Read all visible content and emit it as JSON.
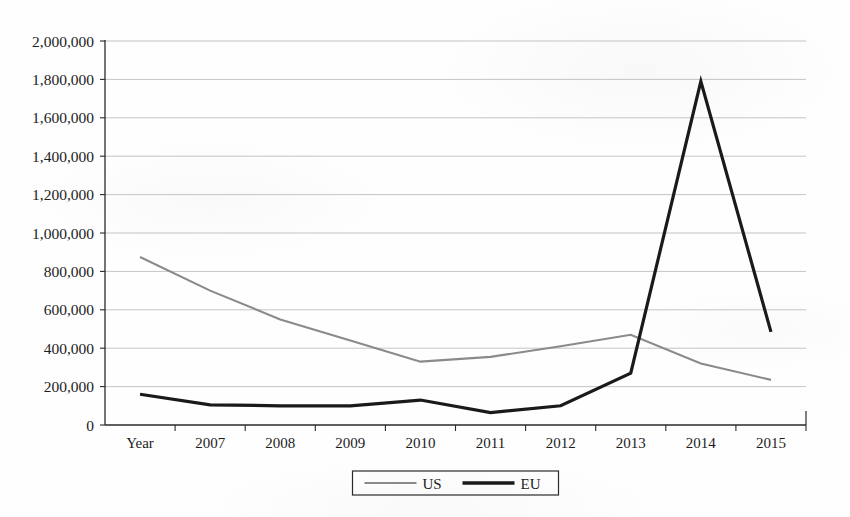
{
  "chart_data": {
    "type": "line",
    "title": "",
    "subtitle": "",
    "xlabel": "",
    "ylabel": "",
    "categories": [
      "Year",
      "2007",
      "2008",
      "2009",
      "2010",
      "2011",
      "2012",
      "2013",
      "2014",
      "2015"
    ],
    "series": [
      {
        "name": "US",
        "color": "#8a8a8a",
        "stroke_width": 2.1,
        "values": [
          875000,
          700000,
          550000,
          440000,
          330000,
          355000,
          410000,
          470000,
          320000,
          235000
        ]
      },
      {
        "name": "EU",
        "color": "#1a1a1a",
        "stroke_width": 3.2,
        "values": [
          160000,
          105000,
          100000,
          100000,
          130000,
          65000,
          100000,
          270000,
          1790000,
          485000
        ]
      }
    ],
    "ylim": [
      0,
      2000000
    ],
    "ytick_step": 200000,
    "ytick_labels": [
      "0",
      "200,000",
      "400,000",
      "600,000",
      "800,000",
      "1,000,000",
      "1,200,000",
      "1,400,000",
      "1,600,000",
      "1,800,000",
      "2,000,000"
    ],
    "ytick_values": [
      0,
      200000,
      400000,
      600000,
      800000,
      1000000,
      1200000,
      1400000,
      1600000,
      1800000,
      2000000
    ],
    "grid": true,
    "grid_axis": "y",
    "legend": {
      "position": "bottom",
      "entries": [
        {
          "label": "US",
          "color": "#8a8a8a",
          "stroke_width": 2.0
        },
        {
          "label": "EU",
          "color": "#1a1a1a",
          "stroke_width": 3.4
        }
      ]
    }
  }
}
